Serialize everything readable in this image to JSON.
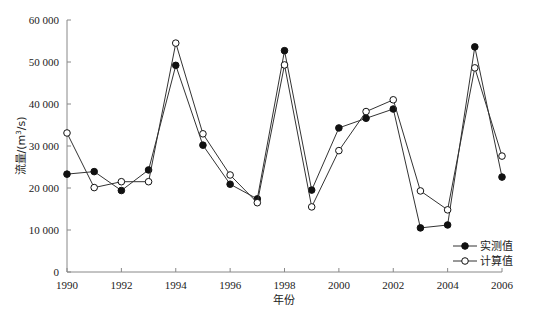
{
  "chart_data": {
    "type": "line",
    "title": "",
    "xlabel": "年份",
    "ylabel": "流量/(m³/s)",
    "ylabel_parts": {
      "main": "流量/(m",
      "sup": "3",
      "tail": "/s)"
    },
    "x": [
      1990,
      1991,
      1992,
      1993,
      1994,
      1995,
      1996,
      1997,
      1998,
      1999,
      2000,
      2001,
      2002,
      2003,
      2004,
      2005,
      2006
    ],
    "xlim": [
      1990,
      2006
    ],
    "ylim": [
      0,
      60000
    ],
    "x_ticks": [
      1990,
      1992,
      1994,
      1996,
      1998,
      2000,
      2002,
      2004,
      2006
    ],
    "x_tick_labels": [
      "1990",
      "1992",
      "1994",
      "1996",
      "1998",
      "2000",
      "2002",
      "2004",
      "2006"
    ],
    "y_ticks": [
      0,
      10000,
      20000,
      30000,
      40000,
      50000,
      60000
    ],
    "y_tick_labels": [
      "0",
      "10 000",
      "20 000",
      "30 000",
      "40 000",
      "50 000",
      "60 000"
    ],
    "grid": false,
    "legend_position": "lower right",
    "series": [
      {
        "name": "实测值",
        "marker": "filled-circle",
        "values": [
          23300,
          23900,
          19400,
          24300,
          49200,
          30200,
          20900,
          17400,
          52700,
          19500,
          34300,
          36600,
          38800,
          10500,
          11200,
          53600,
          22600
        ]
      },
      {
        "name": "计算值",
        "marker": "open-circle",
        "values": [
          33100,
          20100,
          21500,
          21500,
          54500,
          32900,
          23100,
          16500,
          49300,
          15500,
          28900,
          38200,
          41000,
          19300,
          14800,
          48600,
          27600
        ]
      }
    ]
  }
}
